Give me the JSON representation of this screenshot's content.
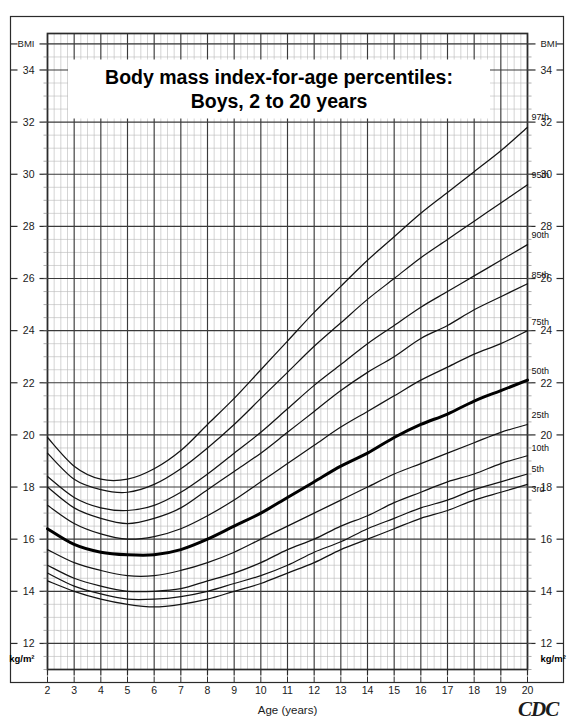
{
  "document": {
    "title_line1": "Body mass index-for-age percentiles:",
    "title_line2": "Boys, 2 to 20 years",
    "source_logo": "CDC"
  },
  "axes": {
    "y_unit_top_left": "BMI",
    "y_unit_top_right": "BMI",
    "y_unit_bottom_left": "kg/m²",
    "y_unit_bottom_right": "kg/m²",
    "x_axis_label": "Age (years)",
    "y_tick_labels": [
      "34",
      "32",
      "30",
      "28",
      "26",
      "24",
      "22",
      "20",
      "18",
      "16",
      "14",
      "12"
    ],
    "x_tick_labels": [
      "2",
      "3",
      "4",
      "5",
      "6",
      "7",
      "8",
      "9",
      "10",
      "11",
      "12",
      "13",
      "14",
      "15",
      "16",
      "17",
      "18",
      "19",
      "20"
    ]
  },
  "colors": {
    "curve": "#141414",
    "median_curve": "#000000",
    "major_grid": "#3a3a3a",
    "minor_grid": "#b9b9b9",
    "border": "#2b2b2b",
    "background": "#ffffff",
    "text": "#111111"
  },
  "chart_data": {
    "type": "line",
    "xlabel": "Age (years)",
    "ylabel": "BMI",
    "y_unit": "kg/m²",
    "xlim": [
      2,
      20
    ],
    "ylim": [
      11,
      35.4
    ],
    "grid": true,
    "legend_position": "right-of-curve-ends",
    "x": [
      2,
      3,
      4,
      5,
      6,
      7,
      8,
      9,
      10,
      11,
      12,
      13,
      14,
      15,
      16,
      17,
      18,
      19,
      20
    ],
    "series": [
      {
        "name": "97th",
        "label": "97th",
        "emphasis": false,
        "values": [
          19.9,
          18.8,
          18.3,
          18.3,
          18.7,
          19.4,
          20.4,
          21.4,
          22.5,
          23.6,
          24.7,
          25.7,
          26.7,
          27.6,
          28.5,
          29.3,
          30.1,
          30.9,
          31.8
        ]
      },
      {
        "name": "95th",
        "label": "95th",
        "emphasis": false,
        "values": [
          19.3,
          18.3,
          17.9,
          17.8,
          18.1,
          18.7,
          19.5,
          20.4,
          21.4,
          22.4,
          23.4,
          24.3,
          25.2,
          26.0,
          26.8,
          27.5,
          28.2,
          28.9,
          29.6
        ]
      },
      {
        "name": "90th",
        "label": "90th",
        "emphasis": false,
        "values": [
          18.4,
          17.6,
          17.2,
          17.1,
          17.3,
          17.8,
          18.5,
          19.3,
          20.1,
          21.0,
          21.9,
          22.7,
          23.5,
          24.2,
          24.9,
          25.5,
          26.1,
          26.7,
          27.3
        ]
      },
      {
        "name": "85th",
        "label": "85th",
        "emphasis": false,
        "values": [
          18.0,
          17.2,
          16.8,
          16.6,
          16.8,
          17.2,
          17.9,
          18.6,
          19.3,
          20.1,
          20.9,
          21.7,
          22.4,
          23.0,
          23.7,
          24.2,
          24.8,
          25.3,
          25.8
        ]
      },
      {
        "name": "75th",
        "label": "75th",
        "emphasis": false,
        "values": [
          17.3,
          16.6,
          16.2,
          16.0,
          16.1,
          16.4,
          16.9,
          17.5,
          18.2,
          18.9,
          19.6,
          20.3,
          20.9,
          21.5,
          22.1,
          22.6,
          23.1,
          23.5,
          24.0
        ]
      },
      {
        "name": "50th",
        "label": "50th",
        "emphasis": true,
        "values": [
          16.4,
          15.8,
          15.5,
          15.4,
          15.4,
          15.6,
          16.0,
          16.5,
          17.0,
          17.6,
          18.2,
          18.8,
          19.3,
          19.9,
          20.4,
          20.8,
          21.3,
          21.7,
          22.1
        ]
      },
      {
        "name": "25th",
        "label": "25th",
        "emphasis": false,
        "values": [
          15.6,
          15.1,
          14.8,
          14.6,
          14.6,
          14.8,
          15.1,
          15.5,
          16.0,
          16.5,
          17.0,
          17.5,
          18.0,
          18.5,
          18.9,
          19.3,
          19.7,
          20.1,
          20.4
        ]
      },
      {
        "name": "10th",
        "label": "10th",
        "emphasis": false,
        "values": [
          15.0,
          14.5,
          14.2,
          14.0,
          14.0,
          14.1,
          14.4,
          14.7,
          15.1,
          15.6,
          16.0,
          16.5,
          16.9,
          17.4,
          17.8,
          18.2,
          18.5,
          18.9,
          19.2
        ]
      },
      {
        "name": "5th",
        "label": "5th",
        "emphasis": false,
        "values": [
          14.7,
          14.2,
          13.9,
          13.7,
          13.7,
          13.8,
          14.0,
          14.3,
          14.6,
          15.0,
          15.5,
          15.9,
          16.4,
          16.8,
          17.2,
          17.5,
          17.9,
          18.2,
          18.5
        ]
      },
      {
        "name": "3rd",
        "label": "3rd",
        "emphasis": false,
        "values": [
          14.4,
          14.0,
          13.7,
          13.5,
          13.4,
          13.5,
          13.7,
          14.0,
          14.3,
          14.7,
          15.1,
          15.6,
          16.0,
          16.4,
          16.8,
          17.1,
          17.5,
          17.8,
          18.1
        ]
      }
    ]
  }
}
